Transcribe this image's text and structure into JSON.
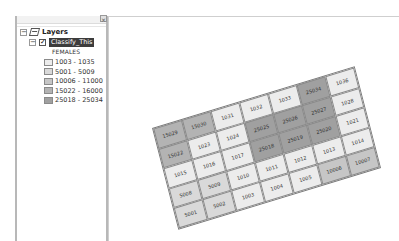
{
  "toc": {
    "close_glyph": "×",
    "root": {
      "label": "Layers",
      "expander": "−",
      "icon": "layers-icon"
    },
    "layer": {
      "label": "Classify_This",
      "expander": "−",
      "checked": "✓"
    },
    "field": "FEMALES",
    "legend": [
      {
        "label": "1003 - 1035",
        "color": "#ececec"
      },
      {
        "label": "5001 - 5009",
        "color": "#d9d9d9"
      },
      {
        "label": "10006 - 11000",
        "color": "#c6c6c6"
      },
      {
        "label": "15022 - 16000",
        "color": "#b3b3b3"
      },
      {
        "label": "25018 - 25034",
        "color": "#a0a0a0"
      }
    ]
  },
  "map": {
    "rows": [
      [
        {
          "v": "15029",
          "c": "#b3b3b3"
        },
        {
          "v": "15030",
          "c": "#b3b3b3"
        },
        {
          "v": "1031",
          "c": "#ececec"
        },
        {
          "v": "1032",
          "c": "#ececec"
        },
        {
          "v": "1033",
          "c": "#ececec"
        },
        {
          "v": "25034",
          "c": "#a0a0a0"
        },
        {
          "v": "1036",
          "c": "#ececec"
        }
      ],
      [
        {
          "v": "15022",
          "c": "#b3b3b3"
        },
        {
          "v": "1023",
          "c": "#ececec"
        },
        {
          "v": "1024",
          "c": "#ececec"
        },
        {
          "v": "25025",
          "c": "#a0a0a0"
        },
        {
          "v": "25026",
          "c": "#a0a0a0"
        },
        {
          "v": "25027",
          "c": "#a0a0a0"
        },
        {
          "v": "1028",
          "c": "#ececec"
        }
      ],
      [
        {
          "v": "1015",
          "c": "#ececec"
        },
        {
          "v": "1016",
          "c": "#ececec"
        },
        {
          "v": "1017",
          "c": "#ececec"
        },
        {
          "v": "25018",
          "c": "#a0a0a0"
        },
        {
          "v": "25019",
          "c": "#a0a0a0"
        },
        {
          "v": "25020",
          "c": "#a0a0a0"
        },
        {
          "v": "1021",
          "c": "#ececec"
        }
      ],
      [
        {
          "v": "5008",
          "c": "#d9d9d9"
        },
        {
          "v": "5009",
          "c": "#d9d9d9"
        },
        {
          "v": "1010",
          "c": "#ececec"
        },
        {
          "v": "1011",
          "c": "#ececec"
        },
        {
          "v": "1012",
          "c": "#ececec"
        },
        {
          "v": "1013",
          "c": "#ececec"
        },
        {
          "v": "1014",
          "c": "#ececec"
        }
      ],
      [
        {
          "v": "5001",
          "c": "#d9d9d9"
        },
        {
          "v": "5002",
          "c": "#d9d9d9"
        },
        {
          "v": "1003",
          "c": "#ececec"
        },
        {
          "v": "1004",
          "c": "#ececec"
        },
        {
          "v": "1005",
          "c": "#ececec"
        },
        {
          "v": "10006",
          "c": "#c6c6c6"
        },
        {
          "v": "10007",
          "c": "#c6c6c6"
        }
      ]
    ]
  }
}
